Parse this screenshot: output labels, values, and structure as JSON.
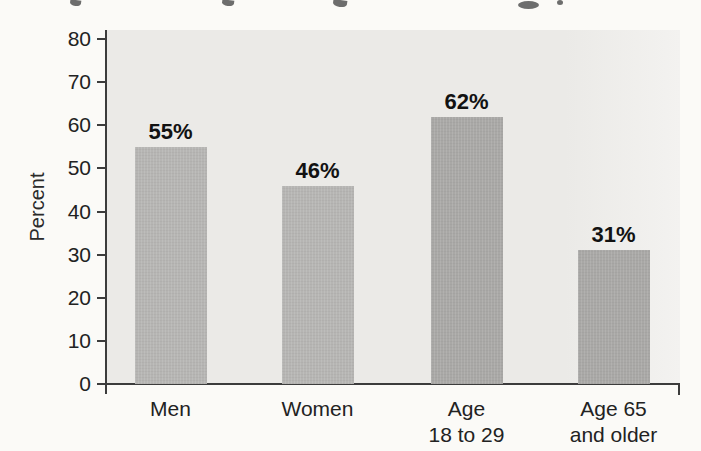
{
  "page": {
    "background": "#fbfaf7"
  },
  "chart_data": {
    "type": "bar",
    "categories": [
      "Men",
      "Women",
      "Age\n18 to 29",
      "Age 65\nand older"
    ],
    "values": [
      55,
      46,
      62,
      31
    ],
    "value_labels": [
      "55%",
      "46%",
      "62%",
      "31%"
    ],
    "ylabel": "Percent",
    "xlabel": "",
    "yticks": [
      0,
      10,
      20,
      30,
      40,
      50,
      60,
      70,
      80
    ],
    "ylim": [
      0,
      80
    ],
    "grid": false,
    "legend": "none",
    "bar_colors": [
      "#b6b5b3",
      "#b6b5b3",
      "#a9a8a6",
      "#a9a8a6"
    ],
    "plot_background": "#ebeae7",
    "axis_color": "#3c3c3c",
    "text_color": "#222222",
    "value_label_color": "#121212"
  }
}
